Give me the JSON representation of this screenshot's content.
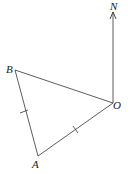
{
  "diagram": {
    "type": "geometry-bearing",
    "points": {
      "O": {
        "label": "O",
        "x": 113,
        "y": 103
      },
      "A": {
        "label": "A",
        "x": 38,
        "y": 156
      },
      "B": {
        "label": "B",
        "x": 15,
        "y": 70
      }
    },
    "north": {
      "label": "N"
    },
    "segments": [
      {
        "from": "B",
        "to": "O",
        "tick": false
      },
      {
        "from": "O",
        "to": "A",
        "tick": true
      },
      {
        "from": "A",
        "to": "B",
        "tick": true
      }
    ],
    "line_color": "#333333"
  }
}
